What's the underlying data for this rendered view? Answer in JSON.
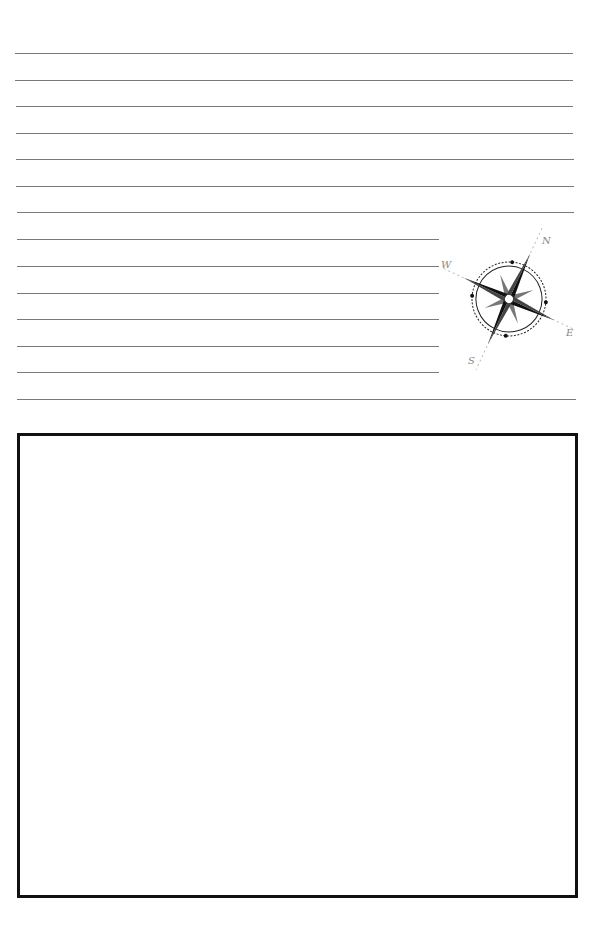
{
  "page": {
    "type": "blank notebook page",
    "background": "#ffffff",
    "rule_color": "#7a7a7a",
    "box_border_color": "#111111"
  },
  "ruled_lines": {
    "full_width": [
      {
        "y": 53,
        "x1": 15,
        "x2": 573
      },
      {
        "y": 80,
        "x1": 15,
        "x2": 573
      },
      {
        "y": 106,
        "x1": 16,
        "x2": 573
      },
      {
        "y": 133,
        "x1": 16,
        "x2": 573
      },
      {
        "y": 159,
        "x1": 16,
        "x2": 574
      },
      {
        "y": 186,
        "x1": 16,
        "x2": 574
      },
      {
        "y": 212,
        "x1": 17,
        "x2": 574
      }
    ],
    "short": [
      {
        "y": 239,
        "x1": 17,
        "x2": 439
      },
      {
        "y": 266,
        "x1": 17,
        "x2": 439
      },
      {
        "y": 293,
        "x1": 17,
        "x2": 439
      },
      {
        "y": 319,
        "x1": 17,
        "x2": 439
      },
      {
        "y": 346,
        "x1": 17,
        "x2": 439
      },
      {
        "y": 372,
        "x1": 17,
        "x2": 439
      }
    ],
    "bottom": [
      {
        "y": 399,
        "x1": 17,
        "x2": 576
      }
    ]
  },
  "compass": {
    "icon": "compass-rose-icon",
    "rotation_deg": 25,
    "labels": {
      "north": "N",
      "east": "E",
      "south": "S",
      "west": "W"
    }
  },
  "drawing_box": {
    "content": ""
  }
}
